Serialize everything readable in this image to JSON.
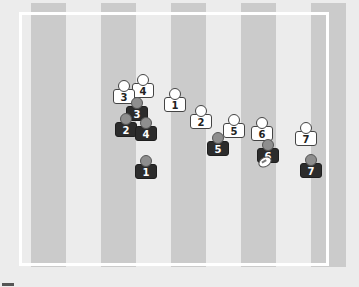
{
  "field": {
    "background_color": "#ececec",
    "stripe_color": "#cbcbcb",
    "line_color": "#ffffff",
    "stripes_x": [
      31,
      101,
      171,
      241,
      311
    ],
    "stripe_width": 35
  },
  "attackers": [
    {
      "number": "1",
      "x": 175,
      "y": 101
    },
    {
      "number": "2",
      "x": 201,
      "y": 118
    },
    {
      "number": "3",
      "x": 124,
      "y": 93
    },
    {
      "number": "4",
      "x": 143,
      "y": 87
    },
    {
      "number": "5",
      "x": 234,
      "y": 127
    },
    {
      "number": "6",
      "x": 262,
      "y": 130
    },
    {
      "number": "7",
      "x": 306,
      "y": 135
    }
  ],
  "defenders": [
    {
      "number": "1",
      "x": 146,
      "y": 168
    },
    {
      "number": "2",
      "x": 126,
      "y": 126
    },
    {
      "number": "3",
      "x": 137,
      "y": 110
    },
    {
      "number": "4",
      "x": 146,
      "y": 130
    },
    {
      "number": "5",
      "x": 218,
      "y": 145
    },
    {
      "number": "6",
      "x": 268,
      "y": 152
    },
    {
      "number": "7",
      "x": 311,
      "y": 167
    }
  ],
  "ball": {
    "x": 264,
    "y": 161
  },
  "colors": {
    "attacker_fill": "#ffffff",
    "defender_body": "#2c2c2c",
    "defender_head": "#8e8e8e"
  }
}
